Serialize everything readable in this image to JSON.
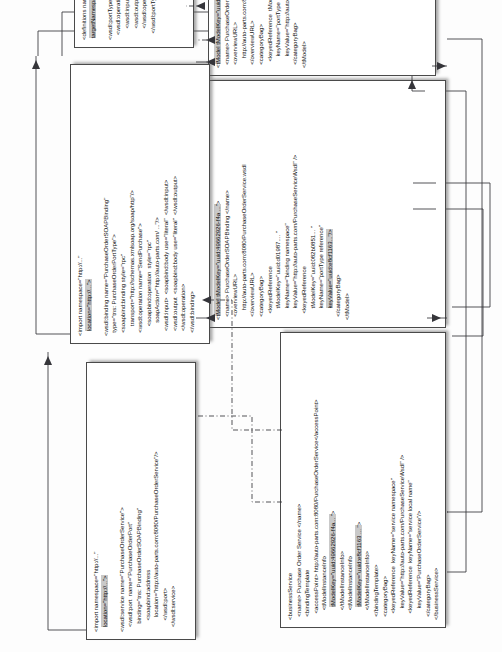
{
  "diagram": {
    "type": "mapping-diagram",
    "orientation": "rotated-90-ccw",
    "colors": {
      "background": "#fdfdfd",
      "box_border": "#4a4a4a",
      "box_fill": "#ffffff",
      "text": "#131313",
      "highlight": "#c9c9c9",
      "connector": "#35353a"
    }
  },
  "boxes": [
    {
      "id": "business-service",
      "name": "businessService-box",
      "lines": [
        {
          "text": "<businessService"
        },
        {
          "text": "  <name> Purchase Order Service </name>"
        },
        {
          "text": "  <bindingTemplate"
        },
        {
          "text": "    <accessPoint> http://auto-parts.com:8080/PurchaseOrderService</accessPoint>"
        },
        {
          "text": "      <tModelInstanceInfo"
        },
        {
          "text": "        tModelKey=\"uuid:49662926-f4a... \">",
          "highlight": "tModelKey=\"uuid:49662926-f4a... \""
        },
        {
          "text": "      </tModelInstanceInfo>"
        },
        {
          "text": "      <tModelInstanceInfo"
        },
        {
          "text": "        tModelKey=\"uuid:e8cf1163 ... \">",
          "highlight": "tModelKey=\"uuid:e8cf1163 ... \""
        },
        {
          "text": "      </tModelInstanceInfo>"
        },
        {
          "text": "  </bindingTemplate>"
        },
        {
          "text": "  <categoryBag>"
        },
        {
          "text": "    <keyedReference  keyName=\"service namespace\""
        },
        {
          "text": "       keyValue=\"http://auto-parts.com/PurchaseServiceWsdl\" />"
        },
        {
          "text": "    <keyedReference  keyName=\"service local name\""
        },
        {
          "text": "       keyValue=\"PurchaseOrderService\"/>"
        },
        {
          "text": "  </categoryBag>"
        },
        {
          "text": "</businessService>"
        }
      ]
    },
    {
      "id": "tmodel-binding",
      "name": "tmodel-binding-box",
      "lines": [
        {
          "text": "<tModel tModelKey=\"uuid:49662926-f4a ...\">",
          "highlight": "tModel tModelKey=\"uuid:49662926-f4a ...\""
        },
        {
          "text": "  <name> PurchaseOrderSOAPBinding </name>"
        },
        {
          "text": "  <overviewURL>"
        },
        {
          "text": "      http://auto-parts.com:8080/PurchaseOrderService.wsdl"
        },
        {
          "text": "  </overviewURL>"
        },
        {
          "text": "  <categoryBag>"
        },
        {
          "text": "    <keyedReference"
        },
        {
          "text": "       tModelKey=\"uuid:d01987.... \""
        },
        {
          "text": "       keyName=\"binding namespace\""
        },
        {
          "text": "       keyValue=\"http://auto-parts.com/PurchaseServiceWsdl\" />"
        },
        {
          "text": "    <keyedReference"
        },
        {
          "text": "       tModelKey=\"uuid:082b0851... \""
        },
        {
          "text": "       keyName=\"portType reference\""
        },
        {
          "text": "       keyValue=\"uuid:e8cf1163...\"/>",
          "highlight": "keyValue=\"uuid:e8cf1163...\"/>"
        },
        {
          "text": "  </categoryBag>"
        },
        {
          "text": "</tModel>"
        }
      ]
    },
    {
      "id": "tmodel-porttype",
      "name": "tmodel-porttype-box",
      "lines": [
        {
          "text": "<tModel tModelKey=\"uuid:e8cf1163 ...\">",
          "highlight": "tModel tModelKey=\"uuid:e8cf1163 ...\""
        },
        {
          "text": "  <name> PurchaseOrderPortType</name>"
        },
        {
          "text": "  <overviewURL>"
        },
        {
          "text": "      http://auto-parts.com:8080/PurchaseOrderService.wsdl"
        },
        {
          "text": "  </overviewURL>"
        },
        {
          "text": "  <categoryBag>"
        },
        {
          "text": "    <keyedReference  tModelKey=\"uuid:d01987d1... \""
        },
        {
          "text": "       keyName=\"portType namespace\""
        },
        {
          "text": "       keyValue=\"http://auto-parts.com/PurchaseServiceWsdl\" />"
        },
        {
          "text": "  </categoryBag>"
        },
        {
          "text": "</tModel>"
        }
      ]
    },
    {
      "id": "wsdl-service",
      "name": "wsdl-service-box",
      "lines": [
        {
          "text": "<import namespace=\"http://...\""
        },
        {
          "text": "   location=\"http://...\">",
          "highlight": "location=\"http://...\">"
        },
        {
          "text": ""
        },
        {
          "text": "<wsdl:service name=\"PurchaseOrderService\">"
        },
        {
          "text": "   <wsdl:port  name=\"PurchaseOrderPort\""
        },
        {
          "text": "     binding=\"tns: PurchaseOrderSOAPBinding\""
        },
        {
          "text": "       <soapbind:address"
        },
        {
          "text": "         location=\"http://auto-parts.com:8080/PurchaseOrderService\"/>"
        },
        {
          "text": "       </wsdl:port>"
        },
        {
          "text": "   </wsdl:service>"
        }
      ]
    },
    {
      "id": "wsdl-binding",
      "name": "wsdl-binding-box",
      "lines": [
        {
          "text": "<import namespace=\"http://...\""
        },
        {
          "text": "   location=\"http://...\">",
          "highlight": "location=\"http://...\">"
        },
        {
          "text": ""
        },
        {
          "text": "<wsdl:binding name=\"PurchaseOrderSOAPBinding\""
        },
        {
          "text": "  type=\"tns: PurchaseOrderPortType\">"
        },
        {
          "text": "  <soapbind:binding style=\"rpc\""
        },
        {
          "text": "      transport=\"http://schemas.xmlsoap.org/soap/http\"/>"
        },
        {
          "text": "  <wsdl:operation name=\"SendPurchase\">"
        },
        {
          "text": "      <soapbind:operation  style=\"rpc\""
        },
        {
          "text": "        soapAction=\"http://auto-parts.com/ ...\"/>"
        },
        {
          "text": "   <wsdl:input>  <soapbind:body use=\"literal\"  </wsdl:input>"
        },
        {
          "text": "   <wsdl:output  <soapbind:body use=\"literal\"  </wsdl:output>"
        },
        {
          "text": "   </wsdl:operation>"
        },
        {
          "text": "  </wsdl:binding>"
        }
      ]
    },
    {
      "id": "wsdl-porttype",
      "name": "wsdl-porttype-box",
      "lines": [
        {
          "text": "<definitions name=\"PurchaseOrderService\""
        },
        {
          "text": " targetNamespace=http://auto-parts.com/ PurchaseService/wsdl",
          "highlight": "targetNamespace=http://auto-parts.com/ PurchaseService/wsdl"
        },
        {
          "text": ""
        },
        {
          "text": "<wsdl:portType name=\"PurchaseOrderPortType\">"
        },
        {
          "text": "   <wsdl:operation name=\"SendPurchase\">"
        },
        {
          "text": "       <wsdl:input message=\"tns: POMessage\"/>"
        },
        {
          "text": "       <wsdl:output message=\"tns: InvMessage\"/>"
        },
        {
          "text": "       </wsdl:operation>"
        },
        {
          "text": "    </wsdl:portType>"
        }
      ]
    }
  ]
}
